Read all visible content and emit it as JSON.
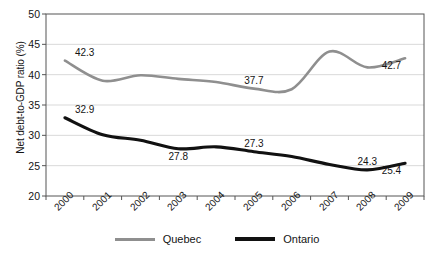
{
  "chart_data": {
    "type": "line",
    "title": "",
    "xlabel": "",
    "ylabel": "Net debt-to-GDP ratio (%)",
    "categories": [
      "2000",
      "2001",
      "2002",
      "2003",
      "2004",
      "2005",
      "2006",
      "2007",
      "2008",
      "2009"
    ],
    "ylim": [
      20,
      50
    ],
    "yticks": [
      20,
      25,
      30,
      35,
      40,
      45,
      50
    ],
    "grid": true,
    "legend_position": "bottom",
    "series": [
      {
        "name": "Quebec",
        "color": "#8f8f8f",
        "values": [
          42.3,
          39.0,
          39.9,
          39.3,
          38.8,
          37.7,
          37.6,
          43.8,
          41.2,
          42.7
        ],
        "point_labels": [
          {
            "category": "2000",
            "value": 42.3,
            "text": "42.3",
            "position": "above"
          },
          {
            "category": "2005",
            "value": 37.7,
            "text": "37.7",
            "position": "above"
          },
          {
            "category": "2009",
            "value": 42.7,
            "text": "42.7",
            "position": "below"
          }
        ]
      },
      {
        "name": "Ontario",
        "color": "#111111",
        "values": [
          32.9,
          30.1,
          29.2,
          27.8,
          28.1,
          27.3,
          26.5,
          25.2,
          24.3,
          25.4
        ],
        "point_labels": [
          {
            "category": "2000",
            "value": 32.9,
            "text": "32.9",
            "position": "above"
          },
          {
            "category": "2003",
            "value": 27.8,
            "text": "27.8",
            "position": "below"
          },
          {
            "category": "2005",
            "value": 27.3,
            "text": "27.3",
            "position": "above"
          },
          {
            "category": "2008",
            "value": 24.3,
            "text": "24.3",
            "position": "above"
          },
          {
            "category": "2009",
            "value": 25.4,
            "text": "25.4",
            "position": "below"
          }
        ]
      }
    ]
  },
  "axis": {
    "y_title": "Net debt-to-GDP ratio (%)",
    "y_tick_labels": [
      "50",
      "45",
      "40",
      "35",
      "30",
      "25",
      "20"
    ],
    "x_tick_labels": [
      "2000",
      "2001",
      "2002",
      "2003",
      "2004",
      "2005",
      "2006",
      "2007",
      "2008",
      "2009"
    ]
  },
  "legend": {
    "items": [
      {
        "label": "Quebec",
        "color": "#8f8f8f"
      },
      {
        "label": "Ontario",
        "color": "#111111"
      }
    ]
  },
  "data_labels": {
    "quebec_2000": "42.3",
    "quebec_2005": "37.7",
    "quebec_2009": "42.7",
    "ontario_2000": "32.9",
    "ontario_2003": "27.8",
    "ontario_2005": "27.3",
    "ontario_2008": "24.3",
    "ontario_2009": "25.4"
  },
  "colors": {
    "quebec_line": "#8f8f8f",
    "ontario_line": "#111111",
    "gridline": "#d9d9d9",
    "axis": "#555555",
    "text": "#141414",
    "background": "#ffffff"
  }
}
